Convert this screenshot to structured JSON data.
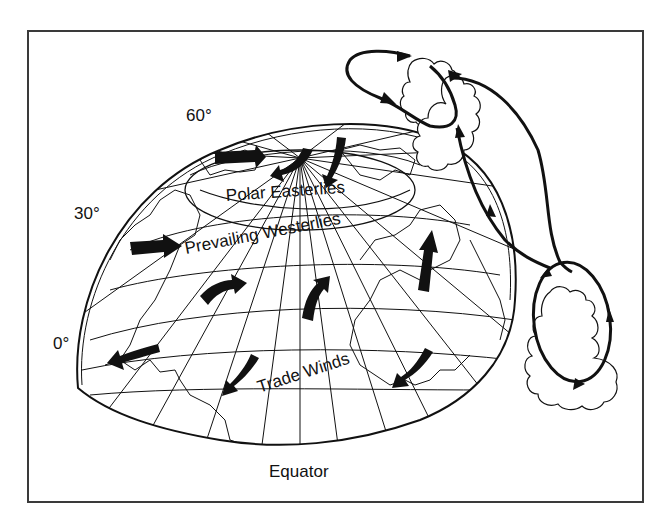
{
  "diagram": {
    "colors": {
      "ink": "#111111",
      "frame": "#3a3a3a",
      "background": "#ffffff"
    },
    "latitude_labels": {
      "lat60": "60°",
      "lat30": "30°",
      "lat0": "0°"
    },
    "wind_belts": {
      "polar": "Polar Easterlies",
      "westerlies": "Prevailing Westerlies",
      "trade": "Trade Winds"
    },
    "equator_label": "Equator",
    "elements": {
      "globe": "hemisphere-globe",
      "cells": [
        "polar-cell-loop",
        "ferrel-connector",
        "hadley-cell-loop"
      ],
      "clouds": [
        "upper-cloud",
        "middle-cloud",
        "lower-cloud"
      ]
    }
  }
}
